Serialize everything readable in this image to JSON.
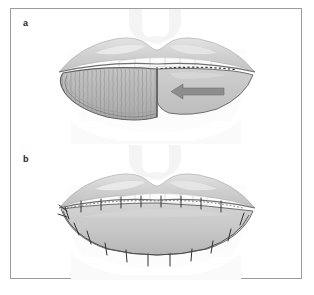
{
  "figure": {
    "panels": [
      {
        "id": "a",
        "label": "a",
        "caption_text": "a",
        "description": "Lower lip with incised vermilion advancement flap; hatched flap tissue and a gray arrow indicating the direction of flap advancement toward the left; dotted incision line along the right vermilion border.",
        "elements": {
          "arrow_direction": "left",
          "arrow_color": "#8d8d8d",
          "flap_hatching": "vertical striations",
          "incision_marking": "dotted line"
        }
      },
      {
        "id": "b",
        "label": "b",
        "caption_text": "b",
        "description": "Closed lower lip after flap advancement, showing interrupted suture marks along the vermilion border and along the lower lip incision line.",
        "elements": {
          "suture_count_upper": 8,
          "suture_count_lower": 9,
          "suture_style": "interrupted"
        }
      }
    ],
    "palette": {
      "frame_border": "#9b9b9b",
      "background": "#ffffff",
      "skin_light": "#f2f2f2",
      "skin_mid": "#dcdcdc",
      "lip_mid": "#c9c9c9",
      "lip_dark": "#b0b0b0",
      "flap_fill": "#b8b8b8",
      "outline": "#6a6a6a",
      "tooth": "#fbfbfb",
      "label_text": "#1d1d1d",
      "arrow": "#8d8d8d"
    }
  }
}
